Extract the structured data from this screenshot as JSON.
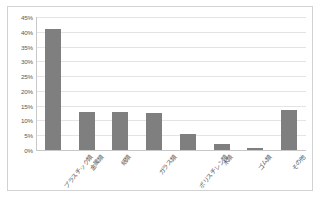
{
  "chart_data": {
    "type": "bar",
    "title": "",
    "subtitle": "",
    "xlabel": "",
    "ylabel": "",
    "categories": [
      "プラスチック類",
      "金属類",
      "紙類",
      "ガラス類",
      "ポリスチレン類",
      "木類",
      "ゴム類",
      "その他"
    ],
    "values": [
      41,
      13,
      13,
      12.5,
      5.5,
      2,
      0.6,
      13.5
    ],
    "value_labels": [
      "41%",
      "13%",
      "13%",
      "12.5%",
      "5.5%",
      "2%",
      "0.6%",
      "13.5%"
    ],
    "ylim": [
      0,
      45
    ],
    "ytick_values": [
      0,
      5,
      10,
      15,
      20,
      25,
      30,
      35,
      40,
      45
    ],
    "ytick_labels": [
      "0%",
      "5%",
      "10%",
      "15%",
      "20%",
      "25%",
      "30%",
      "35%",
      "40%",
      "45%"
    ],
    "grid": true,
    "legend": false,
    "legend_position": "none",
    "series": [
      {
        "name": "",
        "values": [
          41,
          13,
          13,
          12.5,
          5.5,
          2,
          0.6,
          13.5
        ]
      }
    ]
  },
  "style": {
    "bar_color": "#7f7f7f",
    "gridline_color": "#e4e4e4",
    "axis_color": "#c8c8c8",
    "frame_color": "#d2d2d2",
    "tick_text_color": "#595959",
    "plot_background": "#ffffff",
    "page_background": "#ffffff"
  }
}
